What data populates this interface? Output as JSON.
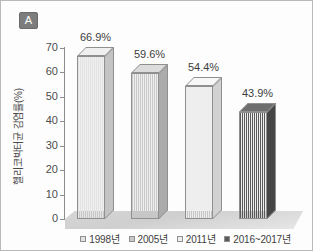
{
  "panel": {
    "tag": "A"
  },
  "chart_data": {
    "type": "bar",
    "title": "",
    "subtitle": "",
    "xlabel": "",
    "ylabel": "헬리코박터균 감염률(%)",
    "ylim": [
      0,
      70
    ],
    "ytick_labels": [
      "0",
      "10",
      "20",
      "30",
      "40",
      "50",
      "60",
      "70"
    ],
    "ytick_values": [
      0,
      10,
      20,
      30,
      40,
      50,
      60,
      70
    ],
    "grid": false,
    "legend_position": "bottom",
    "categories": [
      "1998년",
      "2005년",
      "2011년",
      "2016~2017년"
    ],
    "values": [
      66.9,
      59.6,
      54.4,
      43.9
    ],
    "data_labels": [
      "66.9%",
      "59.6%",
      "54.4%",
      "43.9%"
    ],
    "bar_colors": [
      "#e3e3e3",
      "#c8c8c8",
      "#ededed",
      "#5a5a5a"
    ],
    "bar_side_colors": [
      "#c4c4c4",
      "#ababab",
      "#d2d2d2",
      "#454545"
    ],
    "bar_top_colors": [
      "#efefef",
      "#dcdcdc",
      "#f7f7f7",
      "#6e6e6e"
    ],
    "series": [
      {
        "name": "헬리코박터균 감염률(%)",
        "values": [
          66.9,
          59.6,
          54.4,
          43.9
        ]
      }
    ]
  },
  "legend": {
    "items": [
      {
        "label": "1998년",
        "color": "#e3e3e3"
      },
      {
        "label": "2005년",
        "color": "#c8c8c8"
      },
      {
        "label": "2011년",
        "color": "#ededed"
      },
      {
        "label": "2016~2017년",
        "color": "#5a5a5a"
      }
    ]
  }
}
